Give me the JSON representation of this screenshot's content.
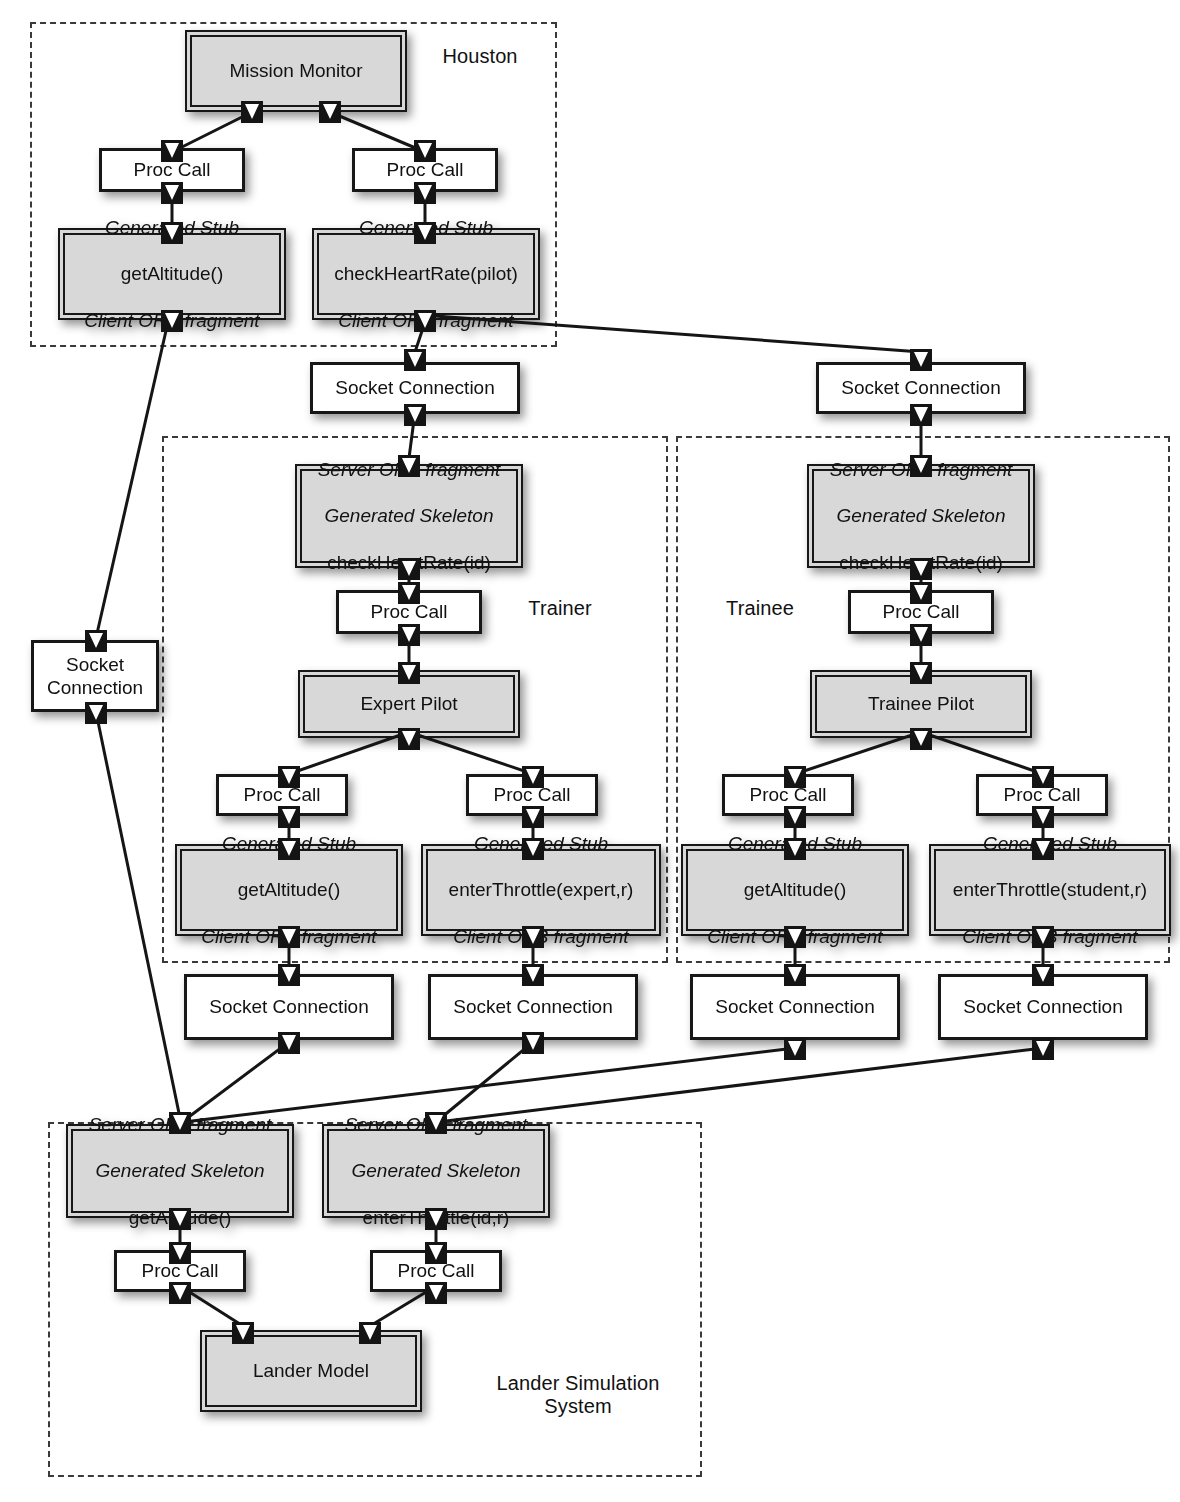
{
  "diagram": {
    "regions": [
      {
        "id": "houston",
        "label": "Houston"
      },
      {
        "id": "trainer",
        "label": "Trainer"
      },
      {
        "id": "trainee",
        "label": "Trainee"
      },
      {
        "id": "lander",
        "label": "Lander Simulation\nSystem"
      }
    ],
    "nodes": {
      "mission_monitor": "Mission Monitor",
      "proc_call": "Proc Call",
      "socket_connection": "Socket Connection",
      "socket_connection_wrapped": "Socket\nConnection",
      "expert_pilot": "Expert Pilot",
      "trainee_pilot": "Trainee Pilot",
      "lander_model": "Lander Model",
      "stub_get_altitude": {
        "line1": "Generated Stub",
        "line2": "getAltitude()",
        "line3": "Client ORB fragment"
      },
      "stub_check_heart_rate": {
        "line1": "Generated Stub",
        "line2": "checkHeartRate(pilot)",
        "line3": "Client ORB fragment"
      },
      "stub_enter_throttle_expert": {
        "line1": "Generated Stub",
        "line2": "enterThrottle(expert,r)",
        "line3": "Client ORB fragment"
      },
      "stub_enter_throttle_student": {
        "line1": "Generated Stub",
        "line2": "enterThrottle(student,r)",
        "line3": "Client ORB fragment"
      },
      "skeleton_check_heart_rate": {
        "line1": "Server ORB fragment",
        "line2": "Generated Skeleton",
        "line3": "checkHeartRate(id)"
      },
      "skeleton_get_altitude": {
        "line1": "Server ORB fragment",
        "line2": "Generated Skeleton",
        "line3": "getAltitude()"
      },
      "skeleton_enter_throttle": {
        "line1": "Server ORB fragment",
        "line2": "Generated Skeleton",
        "line3": "enterThrottle(id,r)"
      }
    },
    "colors": {
      "component_fill": "#d8d8d8",
      "plain_fill": "#ffffff",
      "stroke": "#171717",
      "region_stroke": "#3a3a3a",
      "port_fill": "#141414",
      "text": "#111111"
    }
  }
}
